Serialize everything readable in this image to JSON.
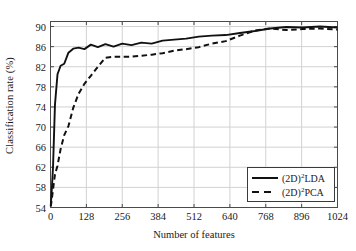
{
  "chart_data": {
    "type": "line",
    "title": "",
    "xlabel": "Number of features",
    "ylabel": "Classification rate (%)",
    "xlim": [
      0,
      1024
    ],
    "ylim": [
      54,
      91
    ],
    "xticks": [
      0,
      128,
      256,
      384,
      512,
      640,
      768,
      896,
      1024
    ],
    "yticks": [
      54,
      58,
      62,
      66,
      70,
      74,
      78,
      82,
      86,
      90
    ],
    "grid": true,
    "legend_position": "lower right",
    "series": [
      {
        "name": "(2D)2LDA",
        "name_base": "(2D)",
        "name_sup": "2",
        "name_tail": "LDA",
        "style": "solid",
        "color": "#111111",
        "x": [
          1,
          4,
          9,
          16,
          25,
          36,
          49,
          64,
          81,
          100,
          121,
          144,
          169,
          196,
          225,
          256,
          289,
          324,
          361,
          400,
          441,
          484,
          529,
          576,
          625,
          676,
          729,
          784,
          841,
          900,
          961,
          1024
        ],
        "y": [
          54.4,
          57.0,
          62.0,
          74.5,
          80.5,
          82.2,
          82.6,
          84.8,
          85.6,
          85.8,
          85.5,
          86.4,
          85.9,
          86.5,
          86.0,
          86.6,
          86.3,
          86.8,
          86.6,
          87.2,
          87.4,
          87.6,
          88.0,
          88.2,
          88.3,
          88.7,
          89.1,
          89.6,
          89.9,
          89.8,
          90.0,
          89.8
        ]
      },
      {
        "name": "(2D)2PCA",
        "name_base": "(2D)",
        "name_sup": "2",
        "name_tail": "PCA",
        "style": "dashed",
        "color": "#111111",
        "x": [
          1,
          4,
          9,
          16,
          25,
          36,
          49,
          64,
          81,
          100,
          121,
          144,
          169,
          196,
          225,
          256,
          289,
          324,
          361,
          400,
          441,
          484,
          529,
          576,
          625,
          676,
          729,
          784,
          841,
          900,
          961,
          1024
        ],
        "y": [
          54.2,
          55.4,
          57.6,
          60.6,
          62.3,
          65.6,
          68.4,
          70.2,
          73.8,
          76.6,
          78.6,
          80.2,
          82.0,
          83.8,
          84.0,
          84.0,
          84.0,
          84.2,
          84.4,
          84.7,
          85.2,
          85.5,
          85.9,
          86.6,
          87.1,
          88.2,
          89.2,
          89.6,
          89.3,
          89.5,
          89.6,
          89.4
        ]
      }
    ]
  }
}
